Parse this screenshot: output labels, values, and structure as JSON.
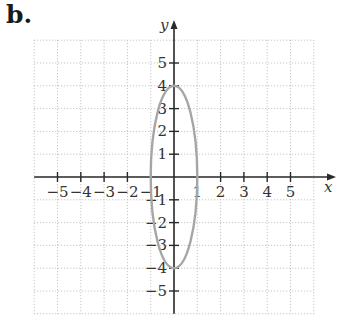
{
  "panel_label": "b.",
  "chart_data": {
    "type": "line",
    "title": "",
    "xlabel": "x",
    "ylabel": "y",
    "xlim": [
      -6,
      6
    ],
    "ylim": [
      -6,
      6
    ],
    "grid": true,
    "grid_style": "dotted",
    "legend": null,
    "x_ticks": [
      -5,
      -4,
      -3,
      -2,
      -1,
      1,
      2,
      3,
      4,
      5
    ],
    "y_ticks": [
      -5,
      -4,
      -3,
      -2,
      -1,
      1,
      2,
      3,
      4,
      5
    ],
    "x_tick_labels": [
      "−5",
      "−4",
      "−3",
      "−2",
      "−1",
      "1",
      "2",
      "3",
      "4",
      "5"
    ],
    "y_tick_labels": [
      "−5",
      "−4",
      "−3",
      "−2",
      "−1",
      "1",
      "2",
      "3",
      "4",
      "5"
    ],
    "series": [
      {
        "name": "ellipse",
        "shape": "ellipse",
        "equation": "x^2 + y^2/16 = 1",
        "center": [
          0,
          0
        ],
        "semi_axis_x": 1,
        "semi_axis_y": 4,
        "vertices": [
          [
            0,
            4
          ],
          [
            0,
            -4
          ],
          [
            1,
            0
          ],
          [
            -1,
            0
          ]
        ],
        "color": "#a6a6a6"
      }
    ]
  },
  "colors": {
    "axis": "#2a2a2a",
    "grid": "#b9b9b9",
    "curve": "#a6a6a6",
    "text": "#333333"
  }
}
